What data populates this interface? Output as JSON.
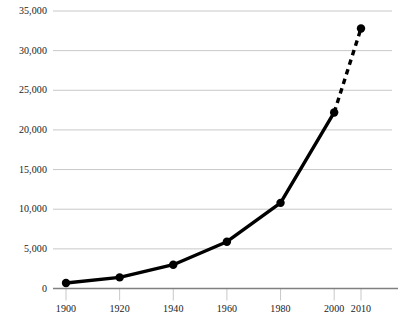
{
  "chart_data": {
    "type": "line",
    "title": "",
    "subtitle": "",
    "xlabel": "",
    "ylabel": "",
    "x": [
      1900,
      1920,
      1940,
      1960,
      1980,
      2000,
      2010
    ],
    "values": [
      700,
      1400,
      3000,
      5900,
      10800,
      22200,
      32800
    ],
    "series": [
      {
        "name": "series-1",
        "values": [
          700,
          1400,
          3000,
          5900,
          10800,
          22200,
          32800
        ],
        "line_style_solid_through": 2000,
        "line_style_dashed_from": 2000,
        "marker": "filled-circle",
        "color": "#000000"
      }
    ],
    "xlim": [
      1893,
      1915
    ],
    "ylim": [
      0,
      35000
    ],
    "ytick_values": [
      0,
      5000,
      10000,
      15000,
      20000,
      25000,
      30000,
      35000
    ],
    "ytick_labels": [
      "0",
      "5,000",
      "10,000",
      "15,000",
      "20,000",
      "25,000",
      "30,000",
      "35,000"
    ],
    "xtick_values": [
      1900,
      1920,
      1940,
      1960,
      1980,
      2000,
      2010
    ],
    "xtick_labels": [
      "1900",
      "1920",
      "1940",
      "1960",
      "1980",
      "2000",
      "2010"
    ],
    "grid": "horizontal",
    "legend": "none",
    "axis_color": "#808080",
    "grid_color": "#c8c8c8",
    "marker_color": "#000000",
    "caption": ""
  }
}
